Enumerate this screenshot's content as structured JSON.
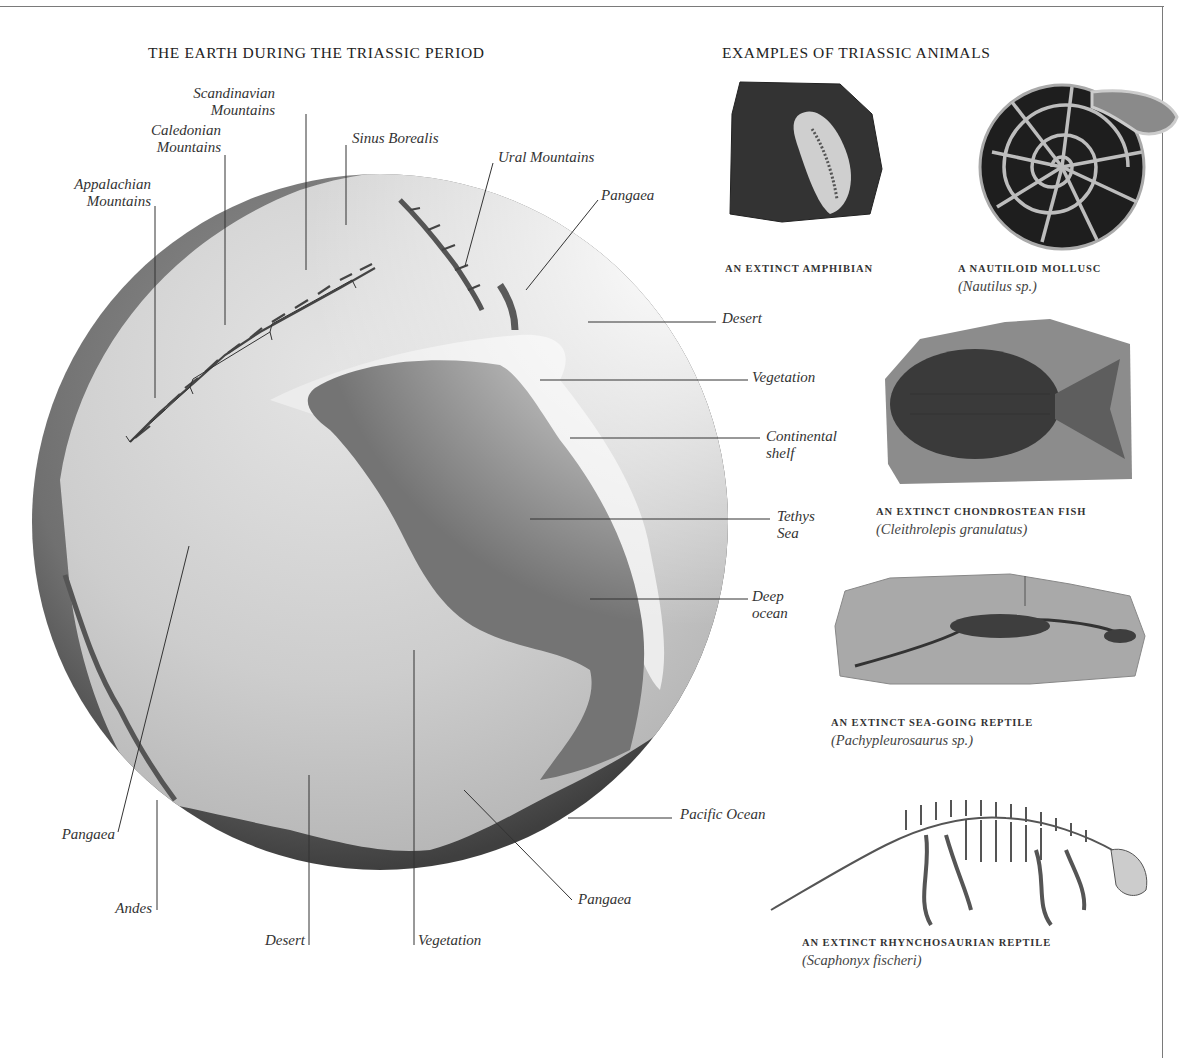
{
  "globe_section": {
    "title": "THE EARTH DURING THE TRIASSIC PERIOD",
    "labels": {
      "scandinavian_mountains": [
        "Scandinavian",
        "Mountains"
      ],
      "caledonian_mountains": [
        "Caledonian",
        "Mountains"
      ],
      "appalachian_mountains": [
        "Appalachian",
        "Mountains"
      ],
      "sinus_borealis": "Sinus Borealis",
      "ural_mountains": "Ural Mountains",
      "pangaea_ne": "Pangaea",
      "desert_e": "Desert",
      "vegetation_e": "Vegetation",
      "continental_shelf": [
        "Continental",
        "shelf"
      ],
      "tethys_sea": [
        "Tethys",
        "Sea"
      ],
      "deep_ocean": [
        "Deep",
        "ocean"
      ],
      "pacific_ocean": "Pacific Ocean",
      "pangaea_sw": "Pangaea",
      "andes": "Andes",
      "desert_s": "Desert",
      "vegetation_s": "Vegetation",
      "pangaea_se": "Pangaea"
    },
    "colors": {
      "ocean": "#6f6f6f",
      "land": "#c9c9c9",
      "shelf": "#e6e6e6",
      "rim": "#4a4a4a"
    }
  },
  "animals_section": {
    "title": "EXAMPLES OF TRIASSIC ANIMALS",
    "items": [
      {
        "caption": "AN EXTINCT AMPHIBIAN",
        "scientific": "",
        "image": "amphibian-fossil"
      },
      {
        "caption": "A NAUTILOID MOLLUSC",
        "scientific": "(Nautilus sp.)",
        "image": "nautilus-shell"
      },
      {
        "caption": "AN EXTINCT CHONDROSTEAN FISH",
        "scientific": "(Cleithrolepis granulatus)",
        "image": "fish-fossil"
      },
      {
        "caption": "AN EXTINCT SEA-GOING REPTILE",
        "scientific": "(Pachypleurosaurus sp.)",
        "image": "sea-reptile-fossil"
      },
      {
        "caption": "AN EXTINCT RHYNCHOSAURIAN REPTILE",
        "scientific": "(Scaphonyx fischeri)",
        "image": "rhynchosaur-skeleton"
      }
    ]
  }
}
